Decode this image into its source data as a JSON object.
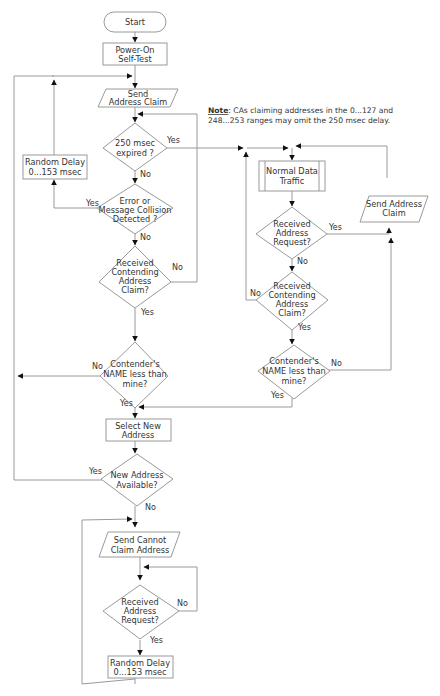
{
  "diagram": {
    "note": {
      "label": "Note",
      "line1": ": CAs claiming addresses in the 0...127 and",
      "line2": "248...253 ranges may omit the 250 msec delay."
    },
    "nodes": {
      "start": {
        "type": "terminator",
        "lines": [
          "Start"
        ]
      },
      "post": {
        "type": "process",
        "lines": [
          "Power-On",
          "Self-Test"
        ]
      },
      "send_claim": {
        "type": "io",
        "lines": [
          "Send",
          "Address Claim"
        ]
      },
      "timer": {
        "type": "decision",
        "lines": [
          "250 msec",
          "expired ?"
        ]
      },
      "random_delay_1": {
        "type": "process",
        "lines": [
          "Random Delay",
          "0...153 msec"
        ]
      },
      "error": {
        "type": "decision",
        "lines": [
          "Error or",
          "Message Collision",
          "Detected ?"
        ]
      },
      "contend_1": {
        "type": "decision",
        "lines": [
          "Received",
          "Contending",
          "Address",
          "Claim?"
        ]
      },
      "name_cmp_1": {
        "type": "decision",
        "lines": [
          "Contender's",
          "NAME less than",
          "mine?"
        ]
      },
      "select_new": {
        "type": "process",
        "lines": [
          "Select New",
          "Address"
        ]
      },
      "new_avail": {
        "type": "decision",
        "lines": [
          "New Address",
          "Available?"
        ]
      },
      "send_cannot": {
        "type": "io",
        "lines": [
          "Send Cannot",
          "Claim Address"
        ]
      },
      "recv_req_2": {
        "type": "decision",
        "lines": [
          "Received",
          "Address",
          "Request?"
        ]
      },
      "random_delay_2": {
        "type": "process",
        "lines": [
          "Random Delay",
          "0...153 msec"
        ]
      },
      "normal": {
        "type": "predefined",
        "lines": [
          "Normal Data",
          "Traffic"
        ]
      },
      "recv_req_1": {
        "type": "decision",
        "lines": [
          "Received",
          "Address",
          "Request?"
        ]
      },
      "send_claim_2": {
        "type": "io",
        "lines": [
          "Send Address",
          "Claim"
        ]
      },
      "contend_2": {
        "type": "decision",
        "lines": [
          "Received",
          "Contending",
          "Address",
          "Claim?"
        ]
      },
      "name_cmp_2": {
        "type": "decision",
        "lines": [
          "Contender's",
          "NAME less than",
          "mine?"
        ]
      }
    },
    "branch_labels": {
      "yes": "Yes",
      "no": "No"
    },
    "edges": [
      {
        "from": "start",
        "to": "post"
      },
      {
        "from": "post",
        "to": "send_claim"
      },
      {
        "from": "send_claim",
        "to": "timer"
      },
      {
        "from": "timer",
        "to": "normal",
        "label": "Yes"
      },
      {
        "from": "timer",
        "to": "error",
        "label": "No"
      },
      {
        "from": "error",
        "to": "random_delay_1",
        "label": "Yes"
      },
      {
        "from": "random_delay_1",
        "to": "send_claim"
      },
      {
        "from": "error",
        "to": "contend_1",
        "label": "No"
      },
      {
        "from": "contend_1",
        "to": "timer",
        "label": "No"
      },
      {
        "from": "contend_1",
        "to": "name_cmp_1",
        "label": "Yes"
      },
      {
        "from": "name_cmp_1",
        "to": "send_claim",
        "label": "No"
      },
      {
        "from": "name_cmp_1",
        "to": "select_new",
        "label": "Yes"
      },
      {
        "from": "select_new",
        "to": "new_avail"
      },
      {
        "from": "new_avail",
        "to": "send_claim",
        "label": "Yes"
      },
      {
        "from": "new_avail",
        "to": "send_cannot",
        "label": "No"
      },
      {
        "from": "send_cannot",
        "to": "recv_req_2"
      },
      {
        "from": "recv_req_2",
        "to": "recv_req_2",
        "label": "No"
      },
      {
        "from": "recv_req_2",
        "to": "random_delay_2",
        "label": "Yes"
      },
      {
        "from": "random_delay_2",
        "to": "send_cannot"
      },
      {
        "from": "normal",
        "to": "recv_req_1"
      },
      {
        "from": "recv_req_1",
        "to": "send_claim_2",
        "label": "Yes"
      },
      {
        "from": "recv_req_1",
        "to": "contend_2",
        "label": "No"
      },
      {
        "from": "send_claim_2",
        "to": "normal"
      },
      {
        "from": "contend_2",
        "to": "normal",
        "label": "No"
      },
      {
        "from": "contend_2",
        "to": "name_cmp_2",
        "label": "Yes"
      },
      {
        "from": "name_cmp_2",
        "to": "send_claim_2",
        "label": "No"
      },
      {
        "from": "name_cmp_2",
        "to": "select_new",
        "label": "Yes"
      }
    ]
  }
}
